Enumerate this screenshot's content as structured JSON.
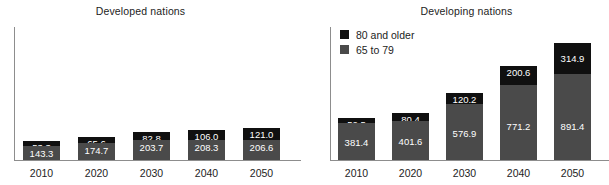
{
  "chart_data": [
    {
      "type": "bar",
      "subtype": "stacked-bar",
      "title": "Developed nations",
      "panel": "left",
      "xlabel": "",
      "ylabel": "",
      "grid": false,
      "legend_position": "none",
      "categories": [
        "2010",
        "2020",
        "2030",
        "2040",
        "2050"
      ],
      "ylim": [
        0,
        1375
      ],
      "series": [
        {
          "name": "65 to 79",
          "color": "#4a4a4a",
          "values": [
            143.3,
            174.7,
            203.7,
            208.3,
            206.6
          ],
          "labels": [
            "143.3",
            "174.7",
            "203.7",
            "208.3",
            "206.6"
          ]
        },
        {
          "name": "80 and older",
          "color": "#101010",
          "values": [
            53.3,
            65.6,
            82.8,
            106.0,
            121.0
          ],
          "labels": [
            "53.3",
            "65.6",
            "82.8",
            "106.0",
            "121.0"
          ]
        }
      ],
      "totals": [
        196.6,
        240.3,
        286.5,
        314.3,
        327.6
      ]
    },
    {
      "type": "bar",
      "subtype": "stacked-bar",
      "title": "Developing nations",
      "panel": "right",
      "xlabel": "",
      "ylabel": "",
      "grid": false,
      "legend_position": "top-left",
      "categories": [
        "2010",
        "2020",
        "2030",
        "2040",
        "2050"
      ],
      "ylim": [
        0,
        1375
      ],
      "series": [
        {
          "name": "65 to 79",
          "color": "#4a4a4a",
          "values": [
            381.4,
            401.6,
            576.9,
            771.2,
            891.4
          ],
          "labels": [
            "381.4",
            "401.6",
            "576.9",
            "771.2",
            "891.4"
          ]
        },
        {
          "name": "80 and older",
          "color": "#101010",
          "values": [
            52.5,
            80.4,
            120.2,
            200.6,
            314.9
          ],
          "labels": [
            "52.5",
            "80.4",
            "120.2",
            "200.6",
            "314.9"
          ]
        }
      ],
      "totals": [
        433.9,
        482.0,
        697.1,
        971.8,
        1206.3
      ]
    }
  ],
  "legend": {
    "items": [
      {
        "label": "80 and older",
        "color": "#101010"
      },
      {
        "label": "65 to 79",
        "color": "#4a4a4a"
      }
    ]
  },
  "colors": {
    "older": "#101010",
    "younger": "#4a4a4a",
    "axis": "#8d8d8d",
    "text": "#1d1d1d",
    "value_text": "#ffffff",
    "background": "#ffffff"
  }
}
